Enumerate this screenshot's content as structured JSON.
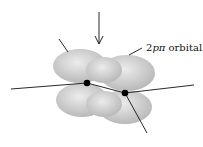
{
  "diagram": {
    "label": {
      "prefix": "2",
      "italic": "pπ",
      "suffix": " orbital"
    },
    "colors": {
      "lobe_light": "#e6e6e6",
      "lobe_dark": "#b3b3b3",
      "line": "#111111",
      "atom": "#000000"
    }
  }
}
